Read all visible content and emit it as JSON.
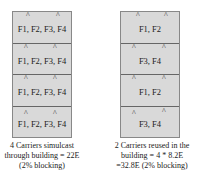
{
  "left": {
    "floors": [
      "F1, F2, F3, F4",
      "F1, F2, F3, F4",
      "F1, F2, F3, F4",
      "F1, F2, F3, F4"
    ],
    "caption": [
      "4 Carriers simulcast",
      "through building = 22E",
      "(2% blocking)"
    ]
  },
  "right": {
    "floors": [
      "F1, F2",
      "F3, F4",
      "F1, F2",
      "F3, F4"
    ],
    "caption": [
      "2 Carriers reused in the",
      "building = 4 * 8.2E",
      "=32.8E (2% blocking)"
    ]
  },
  "antenna_glyph": "^"
}
